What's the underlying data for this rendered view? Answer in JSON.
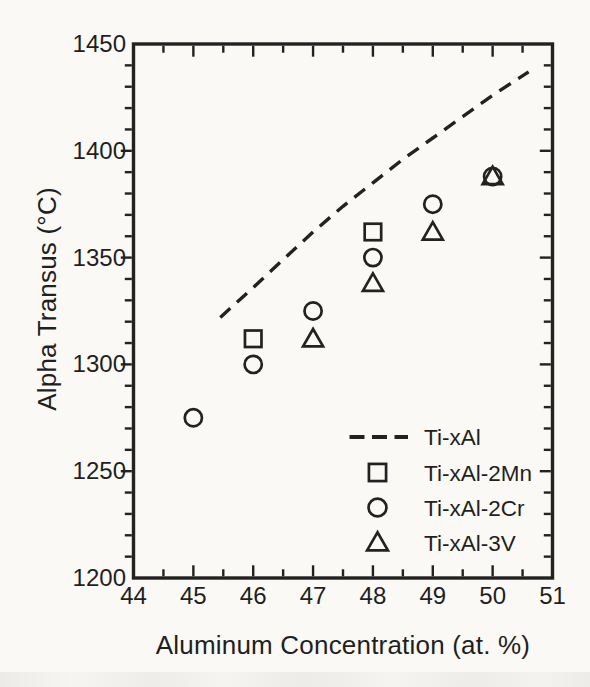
{
  "figure": {
    "background_color": "#faf9f6",
    "ink_color": "#222222"
  },
  "chart_data": {
    "type": "scatter",
    "title": "",
    "xlabel": "Aluminum Concentration (at. %)",
    "ylabel": "Alpha Transus (°C)",
    "xlim": [
      44,
      51
    ],
    "ylim": [
      1200,
      1450
    ],
    "x_major_ticks": [
      44,
      45,
      46,
      47,
      48,
      49,
      50,
      51
    ],
    "x_minor_tick_step": 0.5,
    "y_major_ticks": [
      1200,
      1250,
      1300,
      1350,
      1400,
      1450
    ],
    "y_minor_tick_step": 10,
    "grid": false,
    "legend_position": "lower-right-inside",
    "series": [
      {
        "name": "Ti-xAl",
        "type": "line",
        "line_style": "dashed",
        "marker": "none",
        "points": [
          [
            45.45,
            1322
          ],
          [
            46,
            1336
          ],
          [
            46.5,
            1349
          ],
          [
            47,
            1362
          ],
          [
            47.5,
            1374
          ],
          [
            48,
            1385
          ],
          [
            48.5,
            1396
          ],
          [
            49,
            1406
          ],
          [
            49.5,
            1416
          ],
          [
            50,
            1426
          ],
          [
            50.6,
            1437
          ]
        ]
      },
      {
        "name": "Ti-xAl-2Mn",
        "type": "scatter",
        "marker": "square",
        "points": [
          [
            46,
            1312
          ],
          [
            48,
            1362
          ]
        ]
      },
      {
        "name": "Ti-xAl-2Cr",
        "type": "scatter",
        "marker": "circle",
        "points": [
          [
            45,
            1275
          ],
          [
            46,
            1300
          ],
          [
            47,
            1325
          ],
          [
            48,
            1350
          ],
          [
            49,
            1375
          ],
          [
            50,
            1388
          ]
        ]
      },
      {
        "name": "Ti-xAl-3V",
        "type": "scatter",
        "marker": "triangle",
        "points": [
          [
            47,
            1312
          ],
          [
            48,
            1338
          ],
          [
            49,
            1362
          ],
          [
            50,
            1388
          ]
        ]
      }
    ]
  }
}
